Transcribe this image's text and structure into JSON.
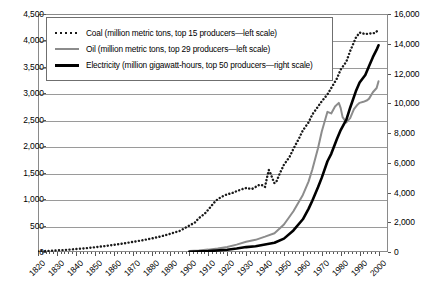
{
  "chart_data": {
    "type": "line",
    "title": "",
    "xlabel": "",
    "ylabel": "",
    "y2label": "",
    "grid": true,
    "legend_position": "top-left-inside",
    "x": [
      1820,
      1830,
      1840,
      1850,
      1860,
      1870,
      1880,
      1890,
      1900,
      1910,
      1920,
      1930,
      1940,
      1950,
      1960,
      1970,
      1980,
      1990,
      2000
    ],
    "xtick_labels": [
      "1820",
      "1830",
      "1840",
      "1850",
      "1860",
      "1870",
      "1880",
      "1890",
      "1900",
      "1910",
      "1920",
      "1930",
      "1940",
      "1950",
      "1960",
      "1970",
      "1980",
      "1990",
      "2000"
    ],
    "xlim": [
      1820,
      2005
    ],
    "ylim": [
      0,
      4500
    ],
    "ytick_labels": [
      "0",
      "500",
      "1,000",
      "1,500",
      "2,000",
      "2,500",
      "3,000",
      "3,500",
      "4,000",
      "4,500"
    ],
    "ytick_values": [
      0,
      500,
      1000,
      1500,
      2000,
      2500,
      3000,
      3500,
      4000,
      4500
    ],
    "y2lim": [
      0,
      16000
    ],
    "y2tick_labels": [
      "0",
      "2,000",
      "4,000",
      "6,000",
      "8,000",
      "10,000",
      "12,000",
      "14,000",
      "16,000"
    ],
    "y2tick_values": [
      0,
      2000,
      4000,
      6000,
      8000,
      10000,
      12000,
      14000,
      16000
    ],
    "series": [
      {
        "name": "Coal",
        "legend_label": "Coal (million metric tons, top 15 producers—left scale)",
        "axis": "left",
        "style": "dotted",
        "color": "#1a1a1a",
        "points": [
          [
            1820,
            10
          ],
          [
            1825,
            20
          ],
          [
            1830,
            30
          ],
          [
            1835,
            40
          ],
          [
            1840,
            55
          ],
          [
            1845,
            70
          ],
          [
            1850,
            90
          ],
          [
            1855,
            110
          ],
          [
            1860,
            135
          ],
          [
            1865,
            160
          ],
          [
            1870,
            190
          ],
          [
            1875,
            220
          ],
          [
            1880,
            255
          ],
          [
            1885,
            295
          ],
          [
            1890,
            345
          ],
          [
            1895,
            400
          ],
          [
            1900,
            500
          ],
          [
            1903,
            560
          ],
          [
            1905,
            640
          ],
          [
            1908,
            720
          ],
          [
            1910,
            800
          ],
          [
            1913,
            930
          ],
          [
            1915,
            1000
          ],
          [
            1918,
            1060
          ],
          [
            1920,
            1090
          ],
          [
            1923,
            1120
          ],
          [
            1925,
            1150
          ],
          [
            1928,
            1190
          ],
          [
            1930,
            1210
          ],
          [
            1933,
            1190
          ],
          [
            1935,
            1230
          ],
          [
            1937,
            1270
          ],
          [
            1939,
            1260
          ],
          [
            1940,
            1230
          ],
          [
            1941,
            1400
          ],
          [
            1942,
            1550
          ],
          [
            1943,
            1480
          ],
          [
            1944,
            1380
          ],
          [
            1945,
            1300
          ],
          [
            1946,
            1330
          ],
          [
            1948,
            1500
          ],
          [
            1950,
            1650
          ],
          [
            1953,
            1800
          ],
          [
            1955,
            1950
          ],
          [
            1958,
            2150
          ],
          [
            1960,
            2300
          ],
          [
            1963,
            2450
          ],
          [
            1965,
            2600
          ],
          [
            1968,
            2750
          ],
          [
            1970,
            2850
          ],
          [
            1973,
            2980
          ],
          [
            1975,
            3100
          ],
          [
            1978,
            3280
          ],
          [
            1980,
            3450
          ],
          [
            1983,
            3600
          ],
          [
            1985,
            3800
          ],
          [
            1988,
            4050
          ],
          [
            1990,
            4150
          ],
          [
            1993,
            4120
          ],
          [
            1995,
            4130
          ],
          [
            1998,
            4140
          ],
          [
            2000,
            4200
          ]
        ]
      },
      {
        "name": "Oil",
        "legend_label": "Oil (million metric tons, top 29 producers—left scale)",
        "axis": "left",
        "style": "solid",
        "color": "#8c8c8c",
        "points": [
          [
            1900,
            20
          ],
          [
            1905,
            30
          ],
          [
            1910,
            45
          ],
          [
            1915,
            65
          ],
          [
            1920,
            95
          ],
          [
            1925,
            140
          ],
          [
            1930,
            195
          ],
          [
            1935,
            230
          ],
          [
            1940,
            290
          ],
          [
            1945,
            355
          ],
          [
            1950,
            520
          ],
          [
            1955,
            770
          ],
          [
            1960,
            1080
          ],
          [
            1963,
            1330
          ],
          [
            1965,
            1560
          ],
          [
            1968,
            1960
          ],
          [
            1970,
            2280
          ],
          [
            1973,
            2650
          ],
          [
            1975,
            2620
          ],
          [
            1977,
            2750
          ],
          [
            1979,
            2820
          ],
          [
            1980,
            2720
          ],
          [
            1981,
            2550
          ],
          [
            1983,
            2450
          ],
          [
            1985,
            2530
          ],
          [
            1987,
            2700
          ],
          [
            1989,
            2790
          ],
          [
            1990,
            2820
          ],
          [
            1992,
            2840
          ],
          [
            1994,
            2870
          ],
          [
            1995,
            2900
          ],
          [
            1997,
            3020
          ],
          [
            1999,
            3100
          ],
          [
            2000,
            3230
          ]
        ]
      },
      {
        "name": "Electricity",
        "legend_label": "Electricity (million gigawatt-hours, top 50 producers—right scale)",
        "axis": "right",
        "style": "solid-thick",
        "color": "#000000",
        "points": [
          [
            1900,
            20
          ],
          [
            1910,
            60
          ],
          [
            1920,
            150
          ],
          [
            1925,
            230
          ],
          [
            1930,
            330
          ],
          [
            1935,
            390
          ],
          [
            1940,
            500
          ],
          [
            1945,
            620
          ],
          [
            1950,
            900
          ],
          [
            1955,
            1450
          ],
          [
            1960,
            2200
          ],
          [
            1963,
            2900
          ],
          [
            1965,
            3450
          ],
          [
            1968,
            4350
          ],
          [
            1970,
            5000
          ],
          [
            1973,
            6100
          ],
          [
            1975,
            6600
          ],
          [
            1978,
            7600
          ],
          [
            1980,
            8200
          ],
          [
            1983,
            8900
          ],
          [
            1985,
            9700
          ],
          [
            1988,
            10800
          ],
          [
            1990,
            11400
          ],
          [
            1993,
            11900
          ],
          [
            1995,
            12500
          ],
          [
            1997,
            13100
          ],
          [
            1999,
            13600
          ],
          [
            2000,
            13900
          ]
        ]
      }
    ]
  }
}
